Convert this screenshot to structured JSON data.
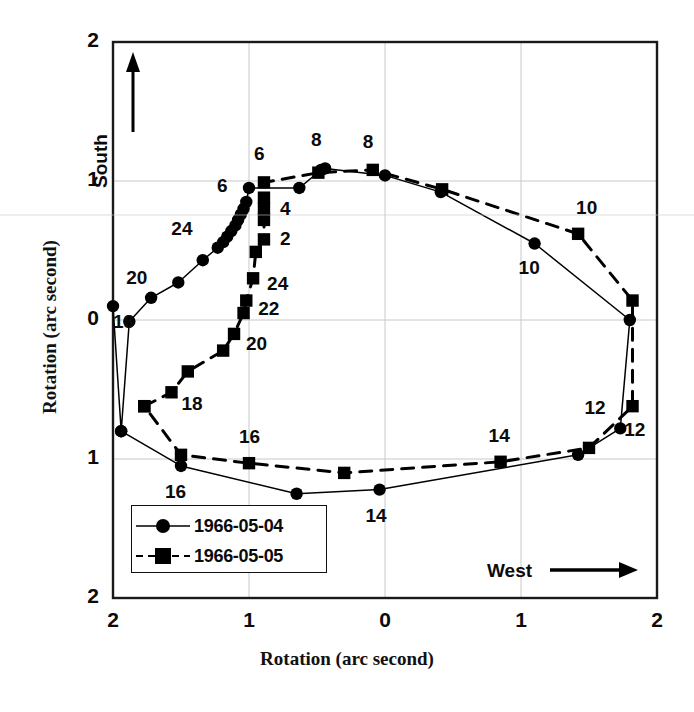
{
  "chart_data": {
    "type": "scatter",
    "title": "",
    "subtitle": "",
    "xlabel": "Rotation (arc second)",
    "ylabel": "Rotation (arc second)",
    "x_tick_labels": [
      "2",
      "1",
      "0",
      "1",
      "2"
    ],
    "y_tick_labels": [
      "2",
      "1",
      "0",
      "1",
      "2"
    ],
    "x_tick_values": [
      -2,
      -1,
      0,
      1,
      2
    ],
    "y_tick_values": [
      2,
      1,
      0,
      -1,
      -2
    ],
    "xlim": [
      -2,
      2
    ],
    "ylim": [
      -2,
      2
    ],
    "grid": true,
    "grid_color": "#c8c8c8",
    "frame_color": "#1a1a1a",
    "axis_direction_labels": {
      "vertical": "South",
      "vertical_arrow": "up-arrow-icon",
      "horizontal": "West",
      "horizontal_arrow": "right-arrow-icon"
    },
    "legend": {
      "position": "lower-left-inside",
      "entries": [
        {
          "name": "1966-05-04",
          "marker": "circle",
          "line": "solid",
          "color": "#000000"
        },
        {
          "name": "1966-05-05",
          "marker": "square",
          "line": "dashed",
          "color": "#000000"
        }
      ]
    },
    "series": [
      {
        "name": "1966-05-04",
        "marker": "circle",
        "line": "solid",
        "color": "#000000",
        "points": [
          {
            "x": -2.0,
            "y": 0.1,
            "label": "18"
          },
          {
            "x": -1.94,
            "y": -0.8,
            "label": ""
          },
          {
            "x": -1.88,
            "y": -0.01,
            "label": ""
          },
          {
            "x": -1.72,
            "y": 0.16,
            "label": ""
          },
          {
            "x": -1.52,
            "y": 0.27,
            "label": "20"
          },
          {
            "x": -1.34,
            "y": 0.43,
            "label": ""
          },
          {
            "x": -1.23,
            "y": 0.52,
            "label": ""
          },
          {
            "x": -1.19,
            "y": 0.56,
            "label": ""
          },
          {
            "x": -1.16,
            "y": 0.6,
            "label": ""
          },
          {
            "x": -1.13,
            "y": 0.64,
            "label": "24"
          },
          {
            "x": -1.1,
            "y": 0.68,
            "label": ""
          },
          {
            "x": -1.08,
            "y": 0.72,
            "label": ""
          },
          {
            "x": -1.06,
            "y": 0.76,
            "label": ""
          },
          {
            "x": -1.04,
            "y": 0.8,
            "label": ""
          },
          {
            "x": -1.02,
            "y": 0.85,
            "label": ""
          },
          {
            "x": -1.0,
            "y": 0.95,
            "label": "6"
          },
          {
            "x": -0.63,
            "y": 0.95,
            "label": ""
          },
          {
            "x": -0.47,
            "y": 1.08,
            "label": "8"
          },
          {
            "x": -0.44,
            "y": 1.09,
            "label": ""
          },
          {
            "x": 0.0,
            "y": 1.04,
            "label": ""
          },
          {
            "x": 0.41,
            "y": 0.92,
            "label": ""
          },
          {
            "x": 1.1,
            "y": 0.55,
            "label": "10"
          },
          {
            "x": 1.8,
            "y": 0.0,
            "label": ""
          },
          {
            "x": 1.73,
            "y": -0.78,
            "label": "12"
          },
          {
            "x": 1.42,
            "y": -0.97,
            "label": ""
          },
          {
            "x": -0.04,
            "y": -1.22,
            "label": "14"
          },
          {
            "x": -0.65,
            "y": -1.25,
            "label": ""
          },
          {
            "x": -1.5,
            "y": -1.05,
            "label": "16"
          },
          {
            "x": -1.94,
            "y": -0.8,
            "label": ""
          }
        ]
      },
      {
        "name": "1966-05-05",
        "marker": "square",
        "line": "dashed",
        "color": "#000000",
        "points": [
          {
            "x": -1.77,
            "y": -0.62,
            "label": ""
          },
          {
            "x": -1.57,
            "y": -0.52,
            "label": "18"
          },
          {
            "x": -1.45,
            "y": -0.37,
            "label": ""
          },
          {
            "x": -1.19,
            "y": -0.22,
            "label": ""
          },
          {
            "x": -1.11,
            "y": -0.1,
            "label": "20"
          },
          {
            "x": -1.04,
            "y": 0.05,
            "label": ""
          },
          {
            "x": -1.02,
            "y": 0.14,
            "label": "22"
          },
          {
            "x": -0.97,
            "y": 0.3,
            "label": "24"
          },
          {
            "x": -0.95,
            "y": 0.49,
            "label": ""
          },
          {
            "x": -0.89,
            "y": 0.58,
            "label": "2"
          },
          {
            "x": -0.89,
            "y": 0.72,
            "label": ""
          },
          {
            "x": -0.89,
            "y": 0.8,
            "label": "4"
          },
          {
            "x": -0.89,
            "y": 0.88,
            "label": ""
          },
          {
            "x": -0.89,
            "y": 0.99,
            "label": "6"
          },
          {
            "x": -0.49,
            "y": 1.06,
            "label": ""
          },
          {
            "x": -0.09,
            "y": 1.08,
            "label": "8"
          },
          {
            "x": 0.42,
            "y": 0.94,
            "label": ""
          },
          {
            "x": 1.42,
            "y": 0.62,
            "label": "10"
          },
          {
            "x": 1.82,
            "y": 0.14,
            "label": ""
          },
          {
            "x": 1.82,
            "y": -0.62,
            "label": "12"
          },
          {
            "x": 1.5,
            "y": -0.92,
            "label": ""
          },
          {
            "x": 0.85,
            "y": -1.02,
            "label": "14"
          },
          {
            "x": -0.3,
            "y": -1.1,
            "label": ""
          },
          {
            "x": -1.0,
            "y": -1.03,
            "label": "16"
          },
          {
            "x": -1.5,
            "y": -0.97,
            "label": ""
          },
          {
            "x": -1.77,
            "y": -0.62,
            "label": ""
          }
        ]
      }
    ],
    "annotations": [
      {
        "text": "18",
        "x": -2.0,
        "y": 0.1,
        "dx": 6,
        "dy": 16
      },
      {
        "text": "20",
        "x": -1.52,
        "y": 0.27,
        "dx": -46,
        "dy": -4
      },
      {
        "text": "24",
        "x": -1.13,
        "y": 0.64,
        "dx": -54,
        "dy": -2
      },
      {
        "text": "6",
        "x": -1.0,
        "y": 0.95,
        "dx": -26,
        "dy": -2
      },
      {
        "text": "8",
        "x": -0.47,
        "y": 1.08,
        "dx": -4,
        "dy": -30
      },
      {
        "text": "10",
        "x": 1.1,
        "y": 0.55,
        "dx": -10,
        "dy": 24
      },
      {
        "text": "12",
        "x": 1.73,
        "y": -0.78,
        "dx": 10,
        "dy": 2
      },
      {
        "text": "14",
        "x": -0.04,
        "y": -1.22,
        "dx": -8,
        "dy": 26
      },
      {
        "text": "16",
        "x": -1.5,
        "y": -1.05,
        "dx": -10,
        "dy": 26
      },
      {
        "text": "18",
        "x": -1.57,
        "y": -0.52,
        "dx": 16,
        "dy": 12
      },
      {
        "text": "20",
        "x": -1.11,
        "y": -0.1,
        "dx": 18,
        "dy": 10
      },
      {
        "text": "22",
        "x": -1.02,
        "y": 0.14,
        "dx": 18,
        "dy": 8
      },
      {
        "text": "24",
        "x": -0.97,
        "y": 0.3,
        "dx": 20,
        "dy": 6
      },
      {
        "text": "2",
        "x": -0.89,
        "y": 0.58,
        "dx": 22,
        "dy": 0
      },
      {
        "text": "4",
        "x": -0.89,
        "y": 0.8,
        "dx": 22,
        "dy": 0
      },
      {
        "text": "6",
        "x": -0.89,
        "y": 0.99,
        "dx": -4,
        "dy": -28
      },
      {
        "text": "8",
        "x": -0.09,
        "y": 1.08,
        "dx": -4,
        "dy": -28
      },
      {
        "text": "10",
        "x": 1.42,
        "y": 0.62,
        "dx": 4,
        "dy": -26
      },
      {
        "text": "12",
        "x": 1.82,
        "y": -0.62,
        "dx": -42,
        "dy": 2
      },
      {
        "text": "14",
        "x": 0.85,
        "y": -1.02,
        "dx": -6,
        "dy": -26
      },
      {
        "text": "16",
        "x": -1.0,
        "y": -1.03,
        "dx": -4,
        "dy": -26
      }
    ]
  }
}
